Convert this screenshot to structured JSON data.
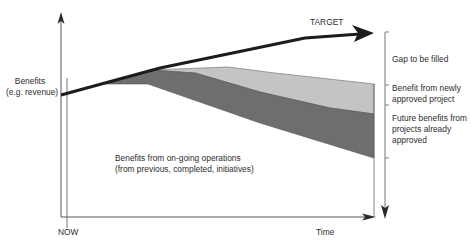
{
  "diagram": {
    "type": "benefits-gap-diagram",
    "y_axis_label_line1": "Benefits",
    "y_axis_label_line2": "(e.g. revenue)",
    "x_axis_label": "Time",
    "now_label": "NOW",
    "target_label": "TARGET",
    "ongoing_label_line1": "Benefits from on-going operations",
    "ongoing_label_line2": "(from previous, completed, initiatives)",
    "legend": [
      {
        "label_lines": [
          "Gap to be filled"
        ],
        "fill": "#ffffff"
      },
      {
        "label_lines": [
          "Benefit from newly",
          "approved project"
        ],
        "fill": "#c2c2c2"
      },
      {
        "label_lines": [
          "Future benefits from",
          "projects already",
          "approved"
        ],
        "fill": "#6b6b6b"
      }
    ],
    "colors": {
      "axis": "#5a5a5a",
      "target_line": "#1a1a1a",
      "light_region": "#c2c2c2",
      "dark_region": "#6b6b6b"
    }
  }
}
